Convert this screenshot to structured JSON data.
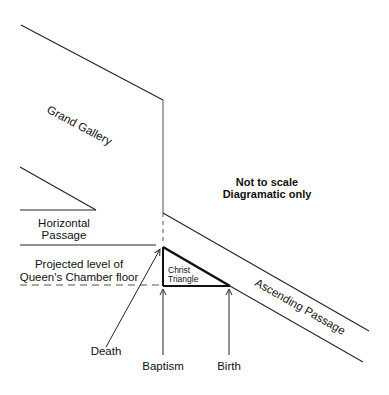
{
  "diagram": {
    "labels": {
      "grand_gallery": "Grand Gallery",
      "note_line1": "Not to scale",
      "note_line2": "Diagramatic only",
      "horizontal_line1": "Horizontal",
      "horizontal_line2": "Passage",
      "projected_line1": "Projected level of",
      "projected_line2": "Queen's Chamber floor",
      "christ_line1": "Christ",
      "christ_line2": "Triangle",
      "ascending_passage": "Ascending Passage",
      "death": "Death",
      "baptism": "Baptism",
      "birth": "Birth"
    },
    "colors": {
      "line": "#222222",
      "background": "#ffffff"
    }
  }
}
